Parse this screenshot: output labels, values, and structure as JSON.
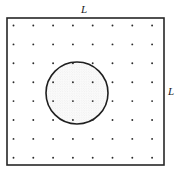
{
  "figure": {
    "background_color": "#ffffff",
    "width": 180,
    "height": 178
  },
  "square": {
    "name": "outer-square",
    "x": 7,
    "y": 18,
    "width": 157,
    "height": 147,
    "stroke_color": "#262626",
    "stroke_width": 1.6,
    "fill": "none",
    "side_label": "L"
  },
  "labels": {
    "top": {
      "text": "L",
      "x": 84,
      "y": 13,
      "anchor": "middle",
      "style": "italic"
    },
    "right": {
      "text": "L",
      "x": 171,
      "y": 95,
      "anchor": "middle",
      "style": "italic"
    }
  },
  "lattice": {
    "name": "point-lattice",
    "rows": 8,
    "cols": 8,
    "count": 64,
    "origin_x": 13.5,
    "origin_y": 25.5,
    "spacing_x": 19.8,
    "spacing_y": 18.9,
    "dot_radius": 0.95,
    "dot_color": "#2b2b2b"
  },
  "circle": {
    "name": "circular-inclusion",
    "cx": 77,
    "cy": 93,
    "r": 31,
    "stroke_color": "#1f1f1f",
    "stroke_width": 1.6,
    "fill_color": "#f2f2f2",
    "fill_description": "light gray stipple"
  },
  "stipple": {
    "dot_color": "#d9d9d9",
    "dot_radius": 0.35,
    "spacing": 2.4
  },
  "chart_data": {
    "type": "scatter",
    "xlabel": "",
    "ylabel": "",
    "xlim": [
      0,
      8
    ],
    "ylim": [
      0,
      8
    ],
    "grid": false,
    "legend": null,
    "annotations": [
      "L",
      "L"
    ],
    "series": [
      {
        "name": "lattice-points",
        "marker": "point",
        "x": [
          1,
          2,
          3,
          4,
          5,
          6,
          7,
          8,
          1,
          2,
          3,
          4,
          5,
          6,
          7,
          8,
          1,
          2,
          3,
          4,
          5,
          6,
          7,
          8,
          1,
          2,
          3,
          4,
          5,
          6,
          7,
          8,
          1,
          2,
          3,
          4,
          5,
          6,
          7,
          8,
          1,
          2,
          3,
          4,
          5,
          6,
          7,
          8,
          1,
          2,
          3,
          4,
          5,
          6,
          7,
          8,
          1,
          2,
          3,
          4,
          5,
          6,
          7,
          8
        ],
        "y": [
          1,
          1,
          1,
          1,
          1,
          1,
          1,
          1,
          2,
          2,
          2,
          2,
          2,
          2,
          2,
          2,
          3,
          3,
          3,
          3,
          3,
          3,
          3,
          3,
          4,
          4,
          4,
          4,
          4,
          4,
          4,
          4,
          5,
          5,
          5,
          5,
          5,
          5,
          5,
          5,
          6,
          6,
          6,
          6,
          6,
          6,
          6,
          6,
          7,
          7,
          7,
          7,
          7,
          7,
          7,
          7,
          8,
          8,
          8,
          8,
          8,
          8,
          8,
          8
        ]
      }
    ],
    "shapes": [
      {
        "kind": "rect",
        "x": 7,
        "y": 18,
        "width": 157,
        "height": 147,
        "label": "L by L square"
      },
      {
        "kind": "circle",
        "cx": 77,
        "cy": 93,
        "r": 31,
        "label": "circular inclusion"
      }
    ]
  }
}
